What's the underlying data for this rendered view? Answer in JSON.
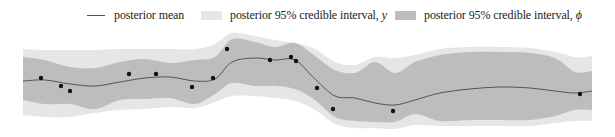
{
  "chart_data": {
    "type": "area",
    "title": "",
    "xlabel": "",
    "ylabel": "",
    "grid": false,
    "legend_position": "top",
    "legend": [
      {
        "label": "posterior mean",
        "kind": "line",
        "color": "#555555"
      },
      {
        "label": "posterior 95% credible interval, ",
        "symbol": "y",
        "kind": "swatch",
        "color": "#e6e6e6"
      },
      {
        "label": "posterior 95% credible interval, ",
        "symbol": "ϕ",
        "kind": "swatch",
        "color": "#bdbdbd"
      }
    ],
    "colors": {
      "outer_band": "#e6e6e6",
      "inner_band": "#bdbdbd",
      "mean_line": "#555555",
      "points": "#111111"
    },
    "pixel_x": [
      23,
      45,
      70,
      95,
      120,
      145,
      170,
      195,
      215,
      232,
      255,
      275,
      295,
      315,
      335,
      355,
      375,
      395,
      415,
      440,
      470,
      500,
      530,
      555,
      575,
      592
    ],
    "mean": [
      81,
      80,
      84,
      86,
      82,
      78,
      77,
      81,
      79,
      62,
      58,
      60,
      60,
      79,
      96,
      98,
      103,
      105,
      100,
      93,
      89,
      87,
      88,
      91,
      93,
      91
    ],
    "inner_upper": [
      57,
      60,
      67,
      68,
      62,
      59,
      63,
      60,
      57,
      39,
      42,
      47,
      43,
      56,
      70,
      73,
      62,
      73,
      62,
      55,
      52,
      52,
      53,
      58,
      72,
      71
    ],
    "inner_lower": [
      100,
      104,
      104,
      109,
      100,
      99,
      98,
      104,
      94,
      83,
      86,
      86,
      89,
      100,
      117,
      121,
      122,
      122,
      114,
      121,
      120,
      120,
      120,
      116,
      110,
      110
    ],
    "outer_upper": [
      49,
      50,
      50,
      50,
      49,
      49,
      49,
      49,
      44,
      33,
      36,
      40,
      43,
      49,
      62,
      65,
      57,
      58,
      55,
      49,
      47,
      47,
      48,
      52,
      57,
      56
    ],
    "outer_lower": [
      115,
      117,
      117,
      113,
      110,
      109,
      107,
      108,
      102,
      96,
      96,
      98,
      101,
      110,
      124,
      128,
      128,
      129,
      125,
      126,
      126,
      126,
      126,
      123,
      121,
      121
    ],
    "points": [
      {
        "x": 41,
        "y": 78
      },
      {
        "x": 61,
        "y": 86
      },
      {
        "x": 70,
        "y": 91
      },
      {
        "x": 129,
        "y": 74
      },
      {
        "x": 156,
        "y": 74
      },
      {
        "x": 192,
        "y": 87
      },
      {
        "x": 213,
        "y": 78
      },
      {
        "x": 227,
        "y": 49
      },
      {
        "x": 270,
        "y": 60
      },
      {
        "x": 291,
        "y": 57
      },
      {
        "x": 296,
        "y": 61
      },
      {
        "x": 317,
        "y": 88
      },
      {
        "x": 333,
        "y": 109
      },
      {
        "x": 393,
        "y": 111
      },
      {
        "x": 580,
        "y": 94
      }
    ]
  }
}
